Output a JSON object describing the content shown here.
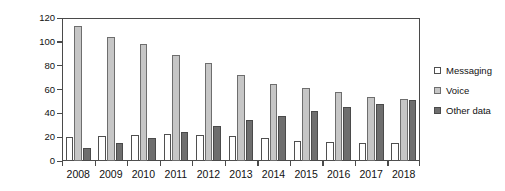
{
  "chart_data": {
    "type": "bar",
    "title": "",
    "xlabel": "",
    "ylabel": "Annual revenue (billion Euros)",
    "categories": [
      "2008",
      "2009",
      "2010",
      "2011",
      "2012",
      "2013",
      "2014",
      "2015",
      "2016",
      "2017",
      "2018"
    ],
    "series": [
      {
        "name": "Messaging",
        "color": "#ffffff",
        "values": [
          20,
          21,
          22,
          23,
          22,
          21,
          19,
          17,
          16,
          15,
          15
        ]
      },
      {
        "name": "Voice",
        "color": "#c6c6c6",
        "values": [
          113,
          104,
          98,
          89,
          82,
          72,
          65,
          61,
          58,
          54,
          52
        ]
      },
      {
        "name": "Other data",
        "color": "#6e6e6e",
        "values": [
          11,
          15,
          19,
          24,
          29,
          34,
          38,
          42,
          45,
          48,
          51
        ]
      }
    ],
    "ylim": [
      0,
      120
    ],
    "yticks": [
      0,
      20,
      40,
      60,
      80,
      100,
      120
    ],
    "ytick_labels": [
      "0",
      "20",
      "40",
      "60",
      "80",
      "100",
      "120"
    ],
    "grid": false,
    "legend_position": "right"
  },
  "legend": {
    "items": [
      {
        "label": "Messaging",
        "swatch": "messaging-swatch-icon"
      },
      {
        "label": "Voice",
        "swatch": "voice-swatch-icon"
      },
      {
        "label": "Other data",
        "swatch": "other-data-swatch-icon"
      }
    ]
  }
}
